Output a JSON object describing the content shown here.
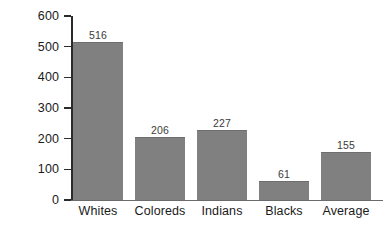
{
  "chart_data": {
    "type": "bar",
    "title": "",
    "xlabel": "",
    "ylabel": "Rand",
    "categories": [
      "Whites",
      "Coloreds",
      "Indians",
      "Blacks",
      "Average"
    ],
    "values": [
      516,
      206,
      227,
      61,
      155
    ],
    "value_labels": [
      "516",
      "206",
      "227",
      "61",
      "155"
    ],
    "ylim": [
      0,
      600
    ],
    "ytick_labels": [
      "600",
      "500",
      "400",
      "300",
      "200",
      "100",
      "0"
    ],
    "yticks": [
      600,
      500,
      400,
      300,
      200,
      100,
      0
    ],
    "grid": false,
    "legend": null,
    "colors": {
      "bar_fill": "#808080",
      "bar_edge": "#6e6e6e",
      "axis": "#2b2b2b",
      "baseline": "#6b6b6b",
      "text": "#1a1a1a",
      "value_text": "#3c3c3c",
      "background": "#ffffff"
    }
  }
}
